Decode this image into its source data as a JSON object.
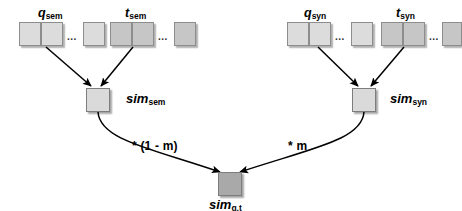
{
  "diagram": {
    "colors": {
      "q_box": "#dcdcdc",
      "t_box": "#c6c6c6",
      "sim_node": "#dadada",
      "final_node": "#a9a9a9",
      "stroke": "#000000",
      "box_border": "#8d8d8d",
      "background": "#ffffff"
    },
    "ellipsis": "...",
    "vector_groups": [
      {
        "id": "q-sem",
        "base": "q",
        "subscript": "sem",
        "shade": "q",
        "cells": 2,
        "trailing_cells": 1
      },
      {
        "id": "t-sem",
        "base": "t",
        "subscript": "sem",
        "shade": "t",
        "cells": 2,
        "trailing_cells": 1
      },
      {
        "id": "q-syn",
        "base": "q",
        "subscript": "syn",
        "shade": "q",
        "cells": 2,
        "trailing_cells": 1
      },
      {
        "id": "t-syn",
        "base": "t",
        "subscript": "syn",
        "shade": "t",
        "cells": 2,
        "trailing_cells": 1
      }
    ],
    "nodes": [
      {
        "id": "sim-sem",
        "base": "sim",
        "subscript": "sem",
        "shade": "light"
      },
      {
        "id": "sim-syn",
        "base": "sim",
        "subscript": "syn",
        "shade": "light"
      },
      {
        "id": "sim-qt",
        "base": "sim",
        "subscript": "q,t",
        "shade": "dark"
      }
    ],
    "edge_weights": [
      {
        "id": "weight-left",
        "label": "* (1 - m)"
      },
      {
        "id": "weight-right",
        "label": "* m"
      }
    ]
  }
}
